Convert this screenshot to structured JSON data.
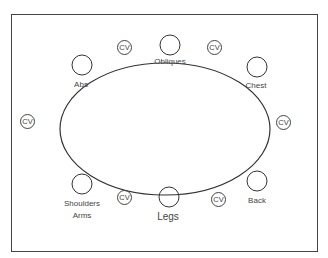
{
  "diagram": {
    "stations": [
      {
        "label": "Obliques"
      },
      {
        "label": "Chest"
      },
      {
        "label": "Back"
      },
      {
        "label": "Legs"
      },
      {
        "label": "Shoulders\nArms",
        "line1": "Shoulders",
        "line2": "Arms"
      },
      {
        "label": "Abs"
      }
    ],
    "cv_label": "CV",
    "cv_count": 8
  }
}
